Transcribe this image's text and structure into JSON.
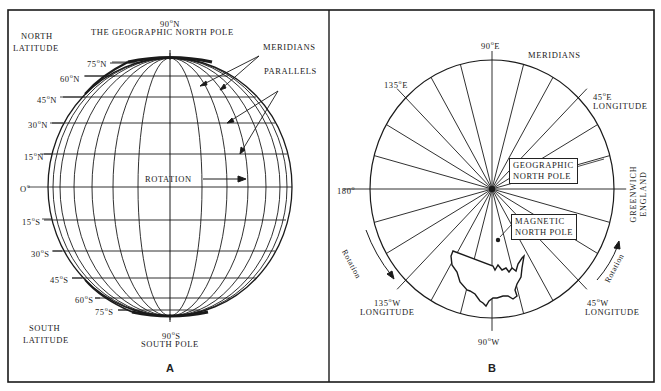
{
  "figure": {
    "panel_a": {
      "letter": "A",
      "north_pole_degree": "90",
      "north_pole_suffix": "N",
      "north_pole_title": "THE GEOGRAPHIC NORTH POLE",
      "north_latitude_line1": "NORTH",
      "north_latitude_line2": "LATITUDE",
      "south_latitude_line1": "SOUTH",
      "south_latitude_line2": "LATITUDE",
      "south_pole_degree": "90",
      "south_pole_suffix": "S",
      "south_pole_title": "SOUTH POLE",
      "meridians_label": "MERIDIANS",
      "parallels_label": "PARALLELS",
      "rotation_label": "ROTATION",
      "latitudes": [
        {
          "deg": "75",
          "suffix": "N"
        },
        {
          "deg": "60",
          "suffix": "N"
        },
        {
          "deg": "45",
          "suffix": "N"
        },
        {
          "deg": "30",
          "suffix": "N"
        },
        {
          "deg": "15",
          "suffix": "N"
        },
        {
          "deg": "O",
          "suffix": ""
        },
        {
          "deg": "15",
          "suffix": "S"
        },
        {
          "deg": "30",
          "suffix": "S"
        },
        {
          "deg": "45",
          "suffix": "S"
        },
        {
          "deg": "60",
          "suffix": "S"
        },
        {
          "deg": "75",
          "suffix": "S"
        }
      ]
    },
    "panel_b": {
      "letter": "B",
      "meridians_label": "MERIDIANS",
      "top_deg": "90",
      "top_suffix": "E",
      "upper_left_deg": "135",
      "upper_left_suffix": "E",
      "upper_right_deg": "45",
      "upper_right_suffix": "E",
      "upper_right_sub": "LONGITUDE",
      "left_deg": "180",
      "lower_left_deg": "135",
      "lower_left_suffix": "W",
      "lower_left_sub": "LONGITUDE",
      "lower_right_deg": "45",
      "lower_right_suffix": "W",
      "lower_right_sub": "LONGITUDE",
      "bottom_deg": "90",
      "bottom_suffix": "W",
      "greenwich_line1": "GREENWICH",
      "greenwich_line2": "ENGLAND",
      "geo_pole_line1": "GEOGRAPHIC",
      "geo_pole_line2": "NORTH POLE",
      "mag_pole_line1": "MAGNETIC",
      "mag_pole_line2": "NORTH POLE",
      "rotation_left": "Rotation",
      "rotation_right": "Rotation"
    }
  },
  "colors": {
    "ink": "#1a1a1a",
    "background": "#ffffff"
  }
}
